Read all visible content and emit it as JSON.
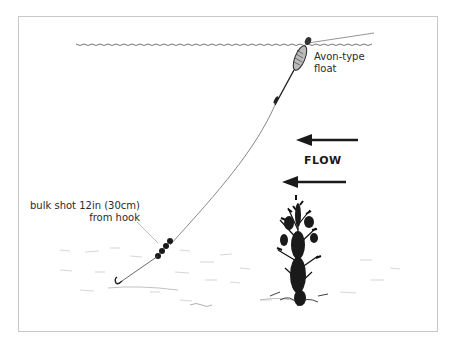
{
  "diagram": {
    "labels": {
      "float": [
        "Avon-type",
        "float"
      ],
      "bulk_shot": [
        "bulk shot 12in (30cm)",
        "from hook"
      ],
      "flow": "FLOW"
    },
    "elements": [
      "water-surface",
      "avon-float",
      "fishing-line",
      "bulk-shot",
      "hook",
      "river-bed",
      "weed-plant",
      "flow-arrows"
    ],
    "colors": {
      "ink": "#1a1a1a",
      "frame": "#c8c8c8",
      "background": "#ffffff"
    }
  }
}
